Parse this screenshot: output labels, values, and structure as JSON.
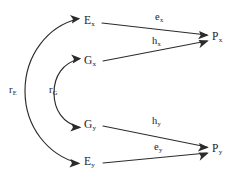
{
  "diagram": {
    "type": "path-diagram",
    "title": "",
    "background_color": "#ffffff",
    "stroke_color": "#2b2b2b",
    "text_color": "#1c1c1c",
    "nodes": [
      {
        "id": "Ex",
        "base": "E",
        "subscript": "x",
        "x": 90,
        "y": 22
      },
      {
        "id": "Gx",
        "base": "G",
        "subscript": "x",
        "x": 90,
        "y": 62
      },
      {
        "id": "Gy",
        "base": "G",
        "subscript": "y",
        "x": 90,
        "y": 125
      },
      {
        "id": "Ey",
        "base": "E",
        "subscript": "y",
        "x": 90,
        "y": 161
      },
      {
        "id": "Px",
        "base": "P",
        "subscript": "x",
        "x": 218,
        "y": 38
      },
      {
        "id": "Py",
        "base": "P",
        "subscript": "y",
        "x": 218,
        "y": 150
      }
    ],
    "edges": [
      {
        "from": "Ex",
        "to": "Px",
        "base": "e",
        "subscript": "x"
      },
      {
        "from": "Gx",
        "to": "Px",
        "base": "h",
        "subscript": "x"
      },
      {
        "from": "Gy",
        "to": "Py",
        "base": "h",
        "subscript": "y"
      },
      {
        "from": "Ey",
        "to": "Py",
        "base": "e",
        "subscript": "y"
      }
    ],
    "arcs": [
      {
        "id": "rE",
        "base": "r",
        "subscript": "E",
        "connects": [
          "Ex",
          "Ey"
        ],
        "double_headed": true
      },
      {
        "id": "rG",
        "base": "r",
        "subscript": "G",
        "connects": [
          "Gx",
          "Gy"
        ],
        "double_headed": true
      }
    ]
  },
  "labels": {
    "node_Ex_base": "E",
    "node_Ex_sub": "x",
    "node_Gx_base": "G",
    "node_Gx_sub": "x",
    "node_Gy_base": "G",
    "node_Gy_sub": "y",
    "node_Ey_base": "E",
    "node_Ey_sub": "y",
    "node_Px_base": "P",
    "node_Px_sub": "x",
    "node_Py_base": "P",
    "node_Py_sub": "y",
    "edge_ex_base": "e",
    "edge_ex_sub": "x",
    "edge_hx_base": "h",
    "edge_hx_sub": "x",
    "edge_hy_base": "h",
    "edge_hy_sub": "y",
    "edge_ey_base": "e",
    "edge_ey_sub": "y",
    "arc_rE_base": "r",
    "arc_rE_sub": "E",
    "arc_rG_base": "r",
    "arc_rG_sub": "G"
  }
}
